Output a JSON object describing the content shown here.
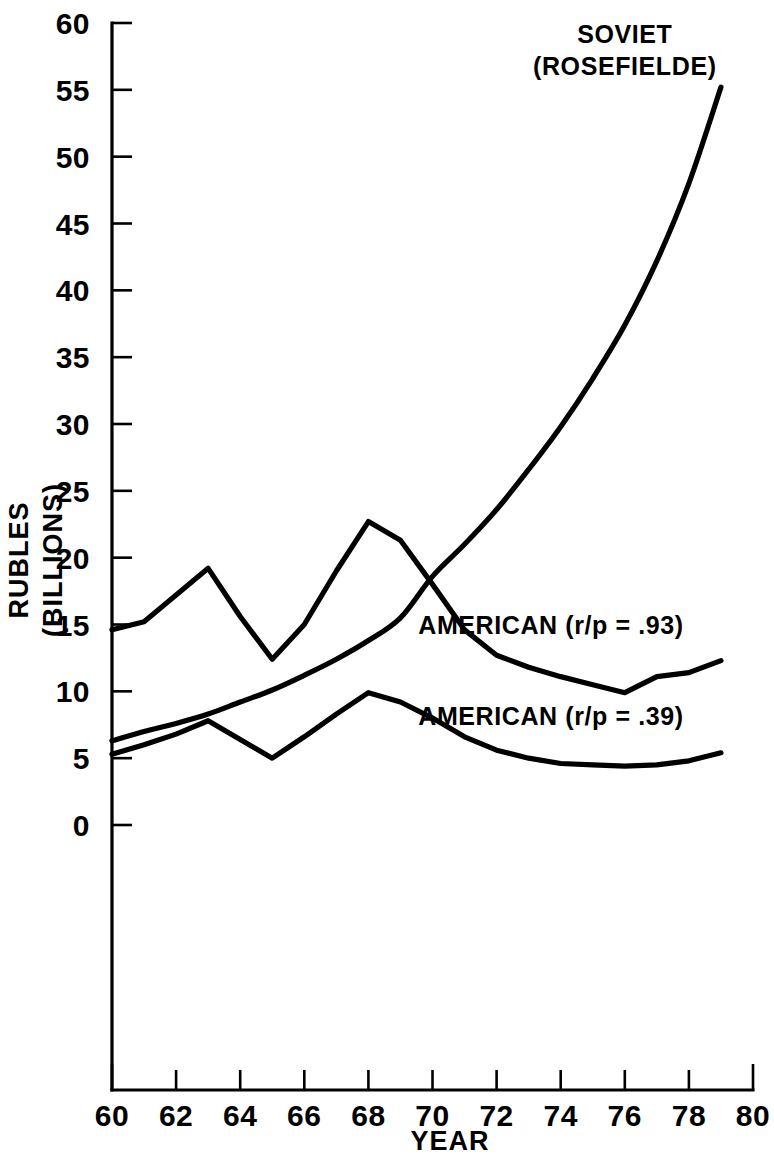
{
  "chart_data": {
    "type": "line",
    "title": "",
    "xlabel": "YEAR",
    "ylabel": "RUBLES\n(BILLIONS)",
    "ylabel_line1": "RUBLES",
    "ylabel_line2": "(BILLIONS)",
    "xlim": [
      60,
      80
    ],
    "ylim": [
      0,
      60
    ],
    "xticks": [
      60,
      62,
      64,
      66,
      68,
      70,
      72,
      74,
      76,
      78,
      80
    ],
    "xtick_labels": [
      "60",
      "62",
      "64",
      "66",
      "68",
      "70",
      "72",
      "74",
      "76",
      "78",
      "80"
    ],
    "yticks": [
      0,
      5,
      10,
      15,
      20,
      25,
      30,
      35,
      40,
      45,
      50,
      55,
      60
    ],
    "ytick_labels": [
      "0",
      "5",
      "10",
      "15",
      "20",
      "25",
      "30",
      "35",
      "40",
      "45",
      "50",
      "55",
      "60"
    ],
    "grid": false,
    "legend_position": "inline-annotations",
    "line_color": "#000000",
    "background_color": "#ffffff",
    "series": [
      {
        "name": "SOVIET (ROSEFIELDE)",
        "label_line1": "SOVIET",
        "label_line2": "(ROSEFIELDE)",
        "label_x": 76.0,
        "label_y": 58.5,
        "smooth": true,
        "x": [
          60,
          61,
          62,
          63,
          64,
          65,
          66,
          67,
          68,
          69,
          70,
          71,
          72,
          73,
          74,
          75,
          76,
          77,
          78,
          79
        ],
        "values": [
          6.3,
          7.0,
          7.6,
          8.3,
          9.2,
          10.1,
          11.2,
          12.4,
          13.8,
          15.5,
          18.6,
          21.0,
          23.6,
          26.6,
          29.8,
          33.4,
          37.4,
          42.2,
          48.0,
          55.2
        ]
      },
      {
        "name": "AMERICAN (r/p = .93)",
        "label": "AMERICAN (r/p = .93)",
        "label_x": 73.3,
        "label_y": 14.3,
        "smooth": false,
        "x": [
          60,
          61,
          62,
          63,
          64,
          65,
          66,
          67,
          68,
          69,
          70,
          71,
          72,
          73,
          74,
          75,
          76,
          77,
          78,
          79
        ],
        "values": [
          14.6,
          15.2,
          17.2,
          19.2,
          15.6,
          12.4,
          15.0,
          19.0,
          22.7,
          21.3,
          18.0,
          14.6,
          12.7,
          11.8,
          11.1,
          10.5,
          9.9,
          11.1,
          11.4,
          12.3
        ]
      },
      {
        "name": "AMERICAN (r/p = .39)",
        "label": "AMERICAN (r/p = .39)",
        "label_x": 73.3,
        "label_y": 7.5,
        "smooth": false,
        "x": [
          60,
          61,
          62,
          63,
          64,
          65,
          66,
          67,
          68,
          69,
          70,
          71,
          72,
          73,
          74,
          75,
          76,
          77,
          78,
          79
        ],
        "values": [
          5.3,
          6.0,
          6.8,
          7.8,
          6.4,
          5.0,
          6.6,
          8.3,
          9.9,
          9.2,
          8.0,
          6.6,
          5.6,
          5.0,
          4.6,
          4.5,
          4.4,
          4.5,
          4.8,
          5.4
        ]
      }
    ]
  }
}
